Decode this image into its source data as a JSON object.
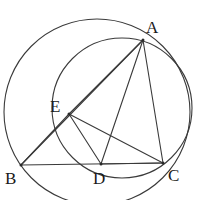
{
  "figure": {
    "type": "geometry-diagram",
    "width": 210,
    "height": 200,
    "stroke_color": "#3a3a3a",
    "label_color": "#1a1a1a",
    "background": "#ffffff",
    "stroke_width": 1.1
  },
  "points": [
    {
      "id": "A",
      "label": "A",
      "x": 143,
      "y": 40,
      "label_x": 146,
      "label_y": 19
    },
    {
      "id": "B",
      "label": "B",
      "x": 21,
      "y": 165,
      "label_x": 5,
      "label_y": 170
    },
    {
      "id": "C",
      "label": "C",
      "x": 163,
      "y": 163,
      "label_x": 168,
      "label_y": 167
    },
    {
      "id": "D",
      "label": "D",
      "x": 101,
      "y": 164,
      "label_x": 93,
      "label_y": 170
    },
    {
      "id": "E",
      "label": "E",
      "x": 69,
      "y": 114,
      "label_x": 50,
      "label_y": 98
    }
  ],
  "circles": [
    {
      "id": "circumcircle-ABC",
      "name": "large-circle",
      "cx": 97,
      "cy": 112,
      "r": 93
    },
    {
      "id": "circle-AEDC",
      "name": "small-circle",
      "cx": 122,
      "cy": 108,
      "r": 70
    }
  ],
  "segments": [
    {
      "id": "AB",
      "from": "A",
      "to": "B"
    },
    {
      "id": "AC",
      "from": "A",
      "to": "C"
    },
    {
      "id": "AD",
      "from": "A",
      "to": "D"
    },
    {
      "id": "AE",
      "from": "A",
      "to": "E"
    },
    {
      "id": "BC",
      "from": "B",
      "to": "C"
    },
    {
      "id": "BE",
      "from": "B",
      "to": "E"
    },
    {
      "id": "EC",
      "from": "E",
      "to": "C"
    },
    {
      "id": "ED",
      "from": "E",
      "to": "D"
    },
    {
      "id": "DC",
      "from": "D",
      "to": "C"
    }
  ]
}
